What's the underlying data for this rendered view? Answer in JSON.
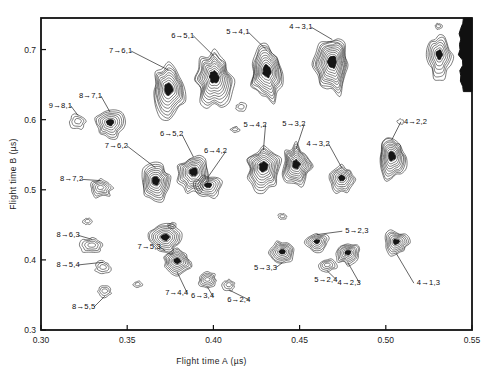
{
  "figure": {
    "type": "contour-map",
    "background": "#ffffff",
    "ink_color": "#151515"
  },
  "axes": {
    "x": {
      "title": "Flight time A (µs)",
      "min": 0.3,
      "max": 0.55,
      "ticks": [
        {
          "value": 0.3,
          "label": "0.30"
        },
        {
          "value": 0.35,
          "label": "0.35"
        },
        {
          "value": 0.4,
          "label": "0.40"
        },
        {
          "value": 0.45,
          "label": "0.45"
        },
        {
          "value": 0.5,
          "label": "0.50"
        },
        {
          "value": 0.55,
          "label": "0.55"
        }
      ]
    },
    "y": {
      "title": "Flight time B (µs)",
      "min": 0.3,
      "max": 0.745,
      "ticks": [
        {
          "value": 0.3,
          "label": "0.3"
        },
        {
          "value": 0.4,
          "label": "0.4"
        },
        {
          "value": 0.5,
          "label": "0.5"
        },
        {
          "value": 0.6,
          "label": "0.6"
        },
        {
          "value": 0.7,
          "label": "0.7"
        }
      ]
    }
  },
  "chart_data": {
    "type": "contour",
    "title": "",
    "xlabel": "Flight time A (µs)",
    "ylabel": "Flight time B (µs)",
    "xlim": [
      0.3,
      0.55
    ],
    "ylim": [
      0.3,
      0.745
    ],
    "grid": false,
    "legend": "none",
    "islands": [
      {
        "label": "9→8,1",
        "x": 0.3215,
        "y": 0.597,
        "w": 0.009,
        "h": 0.021,
        "levels": 3,
        "label_x": 0.3045,
        "label_y": 0.617,
        "leader": true
      },
      {
        "label": "8→7,1",
        "x": 0.34,
        "y": 0.594,
        "w": 0.017,
        "h": 0.04,
        "levels": 7,
        "label_x": 0.322,
        "label_y": 0.631,
        "leader": true
      },
      {
        "label": "7→6,1",
        "x": 0.374,
        "y": 0.64,
        "w": 0.02,
        "h": 0.072,
        "levels": 10,
        "label_x": 0.3395,
        "label_y": 0.695,
        "leader": true
      },
      {
        "label": "6→5,1",
        "x": 0.4005,
        "y": 0.657,
        "w": 0.02,
        "h": 0.078,
        "levels": 11,
        "label_x": 0.3755,
        "label_y": 0.717,
        "leader": true
      },
      {
        "label": "5→4,1",
        "x": 0.431,
        "y": 0.665,
        "w": 0.019,
        "h": 0.08,
        "levels": 11,
        "label_x": 0.4075,
        "label_y": 0.722,
        "leader": true
      },
      {
        "label": "4→3,1",
        "x": 0.469,
        "y": 0.678,
        "w": 0.02,
        "h": 0.085,
        "levels": 12,
        "label_x": 0.444,
        "label_y": 0.729,
        "leader": true
      },
      {
        "label": "8→7,2",
        "x": 0.3345,
        "y": 0.502,
        "w": 0.013,
        "h": 0.026,
        "levels": 5,
        "label_x": 0.311,
        "label_y": 0.512,
        "leader": true
      },
      {
        "label": "7→6,2",
        "x": 0.3665,
        "y": 0.51,
        "w": 0.018,
        "h": 0.05,
        "levels": 9,
        "label_x": 0.337,
        "label_y": 0.56,
        "leader": true
      },
      {
        "label": "6→5,2",
        "x": 0.3885,
        "y": 0.523,
        "w": 0.018,
        "h": 0.055,
        "levels": 9,
        "label_x": 0.369,
        "label_y": 0.576,
        "leader": true
      },
      {
        "label": "6→4,2",
        "x": 0.397,
        "y": 0.505,
        "w": 0.015,
        "h": 0.032,
        "levels": 6,
        "label_x": 0.3945,
        "label_y": 0.552,
        "leader": true
      },
      {
        "label": "5→4,2",
        "x": 0.429,
        "y": 0.53,
        "w": 0.019,
        "h": 0.062,
        "levels": 10,
        "label_x": 0.4175,
        "label_y": 0.59,
        "leader": true
      },
      {
        "label": "5→3,2",
        "x": 0.448,
        "y": 0.533,
        "w": 0.017,
        "h": 0.06,
        "levels": 10,
        "label_x": 0.44,
        "label_y": 0.591,
        "leader": true
      },
      {
        "label": "4→3,2",
        "x": 0.4745,
        "y": 0.515,
        "w": 0.015,
        "h": 0.038,
        "levels": 7,
        "label_x": 0.454,
        "label_y": 0.563,
        "leader": true
      },
      {
        "label": "4→2,2",
        "x": 0.5035,
        "y": 0.545,
        "w": 0.016,
        "h": 0.062,
        "levels": 10,
        "label_x": 0.5105,
        "label_y": 0.594,
        "leader": true
      },
      {
        "label": "8→6,3",
        "x": 0.3295,
        "y": 0.42,
        "w": 0.013,
        "h": 0.022,
        "levels": 4,
        "label_x": 0.309,
        "label_y": 0.432,
        "leader": true
      },
      {
        "label": "7→5,3",
        "x": 0.372,
        "y": 0.43,
        "w": 0.018,
        "h": 0.04,
        "levels": 8,
        "label_x": 0.356,
        "label_y": 0.416,
        "leader": true
      },
      {
        "label": "5→3,3",
        "x": 0.44,
        "y": 0.41,
        "w": 0.015,
        "h": 0.033,
        "levels": 7,
        "label_x": 0.4235,
        "label_y": 0.386,
        "leader": true
      },
      {
        "label": "5→2,3",
        "x": 0.46,
        "y": 0.425,
        "w": 0.013,
        "h": 0.026,
        "levels": 6,
        "label_x": 0.4765,
        "label_y": 0.438,
        "leader": true
      },
      {
        "label": "4→2,3",
        "x": 0.478,
        "y": 0.409,
        "w": 0.014,
        "h": 0.03,
        "levels": 7,
        "label_x": 0.472,
        "label_y": 0.364,
        "leader": true
      },
      {
        "label": "4→1,3",
        "x": 0.506,
        "y": 0.424,
        "w": 0.014,
        "h": 0.034,
        "levels": 7,
        "label_x": 0.518,
        "label_y": 0.364,
        "leader": true
      },
      {
        "label": "8→5,4",
        "x": 0.336,
        "y": 0.389,
        "w": 0.009,
        "h": 0.018,
        "levels": 3,
        "label_x": 0.309,
        "label_y": 0.39,
        "leader": true
      },
      {
        "label": "7→4,4",
        "x": 0.379,
        "y": 0.397,
        "w": 0.016,
        "h": 0.034,
        "levels": 8,
        "label_x": 0.372,
        "label_y": 0.35,
        "leader": true
      },
      {
        "label": "6→3,4",
        "x": 0.3965,
        "y": 0.371,
        "w": 0.011,
        "h": 0.022,
        "levels": 5,
        "label_x": 0.387,
        "label_y": 0.345,
        "leader": true
      },
      {
        "label": "6→2,4",
        "x": 0.409,
        "y": 0.364,
        "w": 0.007,
        "h": 0.016,
        "levels": 3,
        "label_x": 0.408,
        "label_y": 0.34,
        "leader": true
      },
      {
        "label": "5→2,4",
        "x": 0.466,
        "y": 0.392,
        "w": 0.01,
        "h": 0.018,
        "levels": 4,
        "label_x": 0.4585,
        "label_y": 0.369,
        "leader": true
      },
      {
        "label": "8→5,5",
        "x": 0.337,
        "y": 0.355,
        "w": 0.008,
        "h": 0.016,
        "levels": 3,
        "label_x": 0.318,
        "label_y": 0.33,
        "leader": true
      }
    ],
    "unlabeled_islands": [
      {
        "x": 0.531,
        "y": 0.69,
        "w": 0.014,
        "h": 0.06,
        "levels": 7
      },
      {
        "x": 0.5305,
        "y": 0.733,
        "w": 0.004,
        "h": 0.009,
        "levels": 2
      },
      {
        "x": 0.416,
        "y": 0.618,
        "w": 0.006,
        "h": 0.012,
        "levels": 2
      },
      {
        "x": 0.4125,
        "y": 0.586,
        "w": 0.005,
        "h": 0.008,
        "levels": 2
      },
      {
        "x": 0.356,
        "y": 0.365,
        "w": 0.005,
        "h": 0.009,
        "levels": 2
      },
      {
        "x": 0.327,
        "y": 0.455,
        "w": 0.005,
        "h": 0.009,
        "levels": 2
      },
      {
        "x": 0.376,
        "y": 0.449,
        "w": 0.005,
        "h": 0.008,
        "levels": 2
      },
      {
        "x": 0.44,
        "y": 0.462,
        "w": 0.005,
        "h": 0.008,
        "levels": 2
      },
      {
        "x": 0.5085,
        "y": 0.597,
        "w": 0.004,
        "h": 0.007,
        "levels": 1
      }
    ],
    "edge_artifact": {
      "description": "dark saturated band at right frame edge near top",
      "x": 0.5485,
      "y_min": 0.64,
      "y_max": 0.745
    }
  },
  "plot_box": {
    "left_px": 41,
    "top_px": 18,
    "right_px": 472,
    "bottom_px": 330
  }
}
